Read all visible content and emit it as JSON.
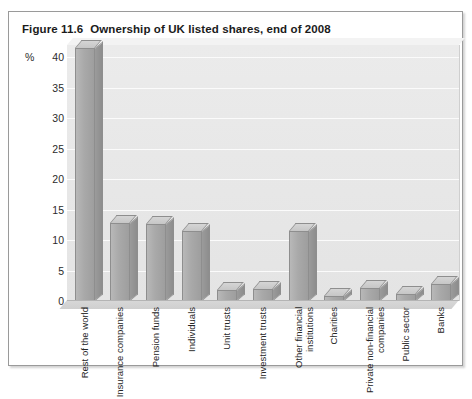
{
  "figure": {
    "number": "Figure 11.6",
    "title": "Ownership of UK listed shares, end of 2008"
  },
  "chart_data": {
    "type": "bar",
    "title": "Ownership of UK listed shares, end of 2008",
    "xlabel": "",
    "ylabel": "%",
    "ylim": [
      0,
      42
    ],
    "yticks": [
      0,
      5,
      10,
      15,
      20,
      25,
      30,
      35,
      40
    ],
    "grid": true,
    "legend": "none",
    "style": "3d-column",
    "categories": [
      "Rest of the world",
      "Insurance companies",
      "Pension funds",
      "Individuals",
      "Unit trusts",
      "Investment trusts",
      "Other financial institutions",
      "Charities",
      "Private non-financial companies",
      "Public sector",
      "Banks"
    ],
    "values": [
      41.5,
      12.8,
      12.6,
      11.5,
      1.8,
      1.9,
      11.5,
      0.8,
      2.2,
      1.1,
      2.8
    ],
    "bar_color": "#a9a9a9",
    "plot_background": "#e8e8e8",
    "gridline_color": "#fbfbfb"
  }
}
